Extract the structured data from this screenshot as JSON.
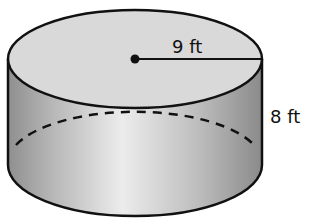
{
  "figure": {
    "shape": "cylinder",
    "labels": {
      "radius": "9 ft",
      "height": "8 ft"
    },
    "colors": {
      "outline": "#111111",
      "top_face": "#d9d9d9",
      "side_light": "#ececec",
      "side_dark": "#8f8f8f"
    }
  }
}
